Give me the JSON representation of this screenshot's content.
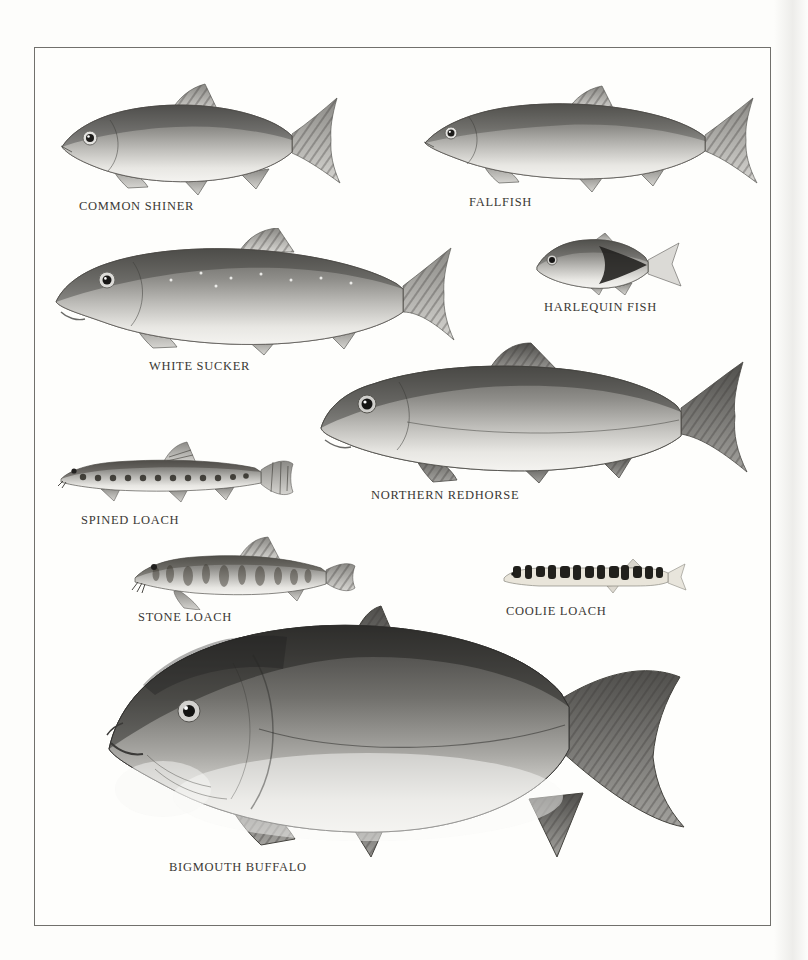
{
  "plate": {
    "fishes": [
      {
        "name": "common-shiner",
        "label": "COMMON SHINER"
      },
      {
        "name": "fallfish",
        "label": "FALLFISH"
      },
      {
        "name": "white-sucker",
        "label": "WHITE SUCKER"
      },
      {
        "name": "harlequin-fish",
        "label": "HARLEQUIN FISH"
      },
      {
        "name": "spined-loach",
        "label": "SPINED LOACH"
      },
      {
        "name": "northern-redhorse",
        "label": "NORTHERN REDHORSE"
      },
      {
        "name": "stone-loach",
        "label": "STONE LOACH"
      },
      {
        "name": "coolie-loach",
        "label": "COOLIE LOACH"
      },
      {
        "name": "bigmouth-buffalo",
        "label": "BIGMOUTH BUFFALO"
      }
    ],
    "colors": {
      "border": "#71706c",
      "label_text": "#3a3834",
      "background": "#fefefc"
    }
  }
}
